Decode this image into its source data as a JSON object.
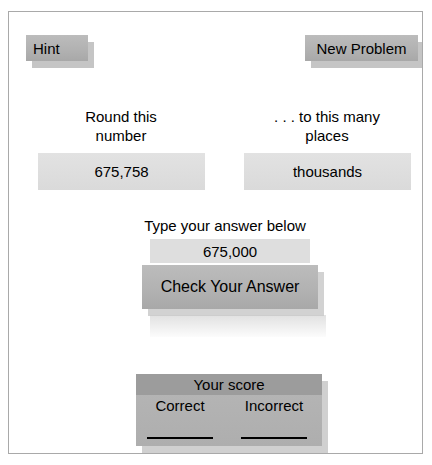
{
  "toolbar": {
    "hint_label": "Hint",
    "new_problem_label": "New Problem"
  },
  "problem": {
    "number_prompt_label": "Round this\nnumber",
    "number_value": "675,758",
    "places_prompt_label": ". . . to this many\nplaces",
    "places_value": "thousands"
  },
  "answer": {
    "instruction_label": "Type your answer below",
    "value": "675,000",
    "placeholder": "",
    "check_button_label": "Check Your Answer"
  },
  "score": {
    "title": "Your score",
    "columns": [
      {
        "label": "Correct",
        "value": ""
      },
      {
        "label": "Incorrect",
        "value": ""
      }
    ]
  },
  "colors": {
    "page_background": "#ffffff",
    "frame_border": "#a9a9a9",
    "button_face": "#b4b4b4",
    "button_shadow": "#969696",
    "value_box": "#dcdcdc",
    "answer_field": "#dedede",
    "score_panel": "#b3b3b3",
    "score_title_band": "#9c9c9c",
    "text": "#000000"
  }
}
